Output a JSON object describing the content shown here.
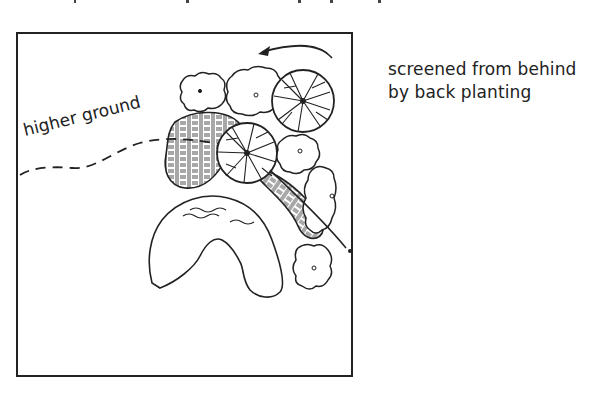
{
  "diagram": {
    "type": "garden-plan-sketch",
    "annotations": {
      "screened_line1": "screened from behind",
      "screened_line2": "by back planting",
      "higher_ground": "higher ground"
    },
    "elements": [
      {
        "kind": "frame",
        "description": "square plot boundary"
      },
      {
        "kind": "pond",
        "description": "kidney-shaped pond with water ripples"
      },
      {
        "kind": "tree",
        "count": 2,
        "description": "circular tree canopies with radiating branch lines"
      },
      {
        "kind": "shrub",
        "count": 6,
        "description": "cloud-outline shrubs with center dots"
      },
      {
        "kind": "groundcover",
        "count": 2,
        "description": "basket-weave hatched planting beds"
      },
      {
        "kind": "contour",
        "description": "dashed line marking higher ground"
      },
      {
        "kind": "arrow",
        "description": "curved arrow pointing into back planting"
      }
    ],
    "colors": {
      "ink": "#222222",
      "background": "#ffffff"
    }
  }
}
